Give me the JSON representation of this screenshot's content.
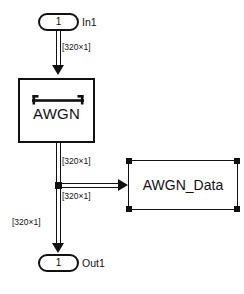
{
  "diagram": {
    "background_color": "#ffffff",
    "line_color": "#111111",
    "blocks": [
      {
        "id": "in1",
        "type": "inport",
        "port_number": "1",
        "label": "In1",
        "selected": false
      },
      {
        "id": "awgn",
        "type": "subsystem",
        "label": "AWGN",
        "icon": "noise-bar-icon",
        "selected": false
      },
      {
        "id": "awgn_data",
        "type": "to-workspace",
        "label": "AWGN_Data",
        "selected": true
      },
      {
        "id": "out1",
        "type": "outport",
        "port_number": "1",
        "label": "Out1",
        "selected": false
      }
    ],
    "signals": [
      {
        "id": "sig_in_to_awgn",
        "dimension_label": "[320×1]"
      },
      {
        "id": "sig_awgn_to_branch",
        "dimension_label": "[320×1]"
      },
      {
        "id": "sig_branch_to_data",
        "dimension_label": "[320×1]"
      },
      {
        "id": "sig_branch_to_out",
        "dimension_label": "[320×1]"
      }
    ]
  }
}
